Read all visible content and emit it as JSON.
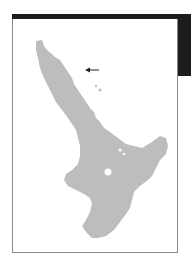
{
  "map": {
    "subject": "North Island, New Zealand",
    "land_color": "#bdbdbd",
    "water_color": "#ffffff",
    "frame_color": "#8a8a8a",
    "header_color": "#1c1c1c",
    "marker": {
      "type": "arrow",
      "direction": "left",
      "x": 86,
      "y": 70
    }
  }
}
